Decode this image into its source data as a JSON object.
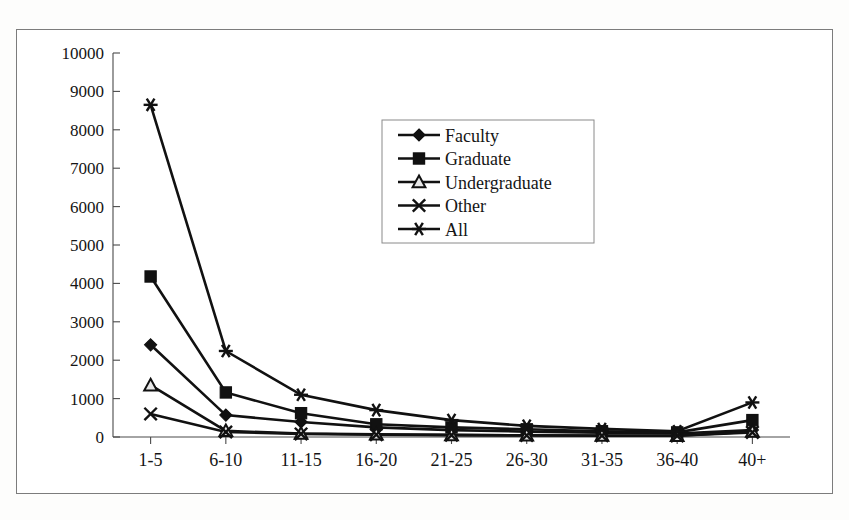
{
  "figure": {
    "frame_color": "#7c7c7c",
    "background": "#ffffff",
    "series_color": "#111111"
  },
  "chart_data": {
    "type": "line",
    "title": "",
    "subtitle": "",
    "xlabel": "",
    "ylabel": "",
    "grid": false,
    "legend_position": "inside-top-center",
    "categories": [
      "1-5",
      "6-10",
      "11-15",
      "16-20",
      "21-25",
      "26-30",
      "31-35",
      "36-40",
      "40+"
    ],
    "ylim": [
      0,
      10000
    ],
    "ytick_labels": [
      "10000",
      "9000",
      "8000",
      "7000",
      "6000",
      "5000",
      "4000",
      "3000",
      "2000",
      "1000",
      "0"
    ],
    "ytick_values": [
      10000,
      9000,
      8000,
      7000,
      6000,
      5000,
      4000,
      3000,
      2000,
      1000,
      0
    ],
    "series": [
      {
        "name": "Faculty",
        "marker": "filled-diamond",
        "values": [
          2400,
          570,
          390,
          250,
          180,
          140,
          110,
          90,
          180
        ]
      },
      {
        "name": "Graduate",
        "marker": "filled-square",
        "values": [
          4180,
          1160,
          620,
          330,
          250,
          200,
          150,
          120,
          440
        ]
      },
      {
        "name": "Undergraduate",
        "marker": "open-triangle",
        "values": [
          1350,
          160,
          90,
          70,
          55,
          45,
          40,
          35,
          140
        ]
      },
      {
        "name": "Other",
        "marker": "cross-x",
        "values": [
          600,
          130,
          80,
          60,
          50,
          40,
          35,
          30,
          120
        ]
      },
      {
        "name": "All",
        "marker": "asterisk",
        "values": [
          8650,
          2240,
          1100,
          700,
          440,
          290,
          210,
          150,
          900
        ]
      }
    ]
  },
  "legend": {
    "entries": [
      {
        "label": "Faculty",
        "marker": "filled-diamond"
      },
      {
        "label": "Graduate",
        "marker": "filled-square"
      },
      {
        "label": "Undergraduate",
        "marker": "open-triangle"
      },
      {
        "label": "Other",
        "marker": "cross-x"
      },
      {
        "label": "All",
        "marker": "asterisk"
      }
    ]
  }
}
